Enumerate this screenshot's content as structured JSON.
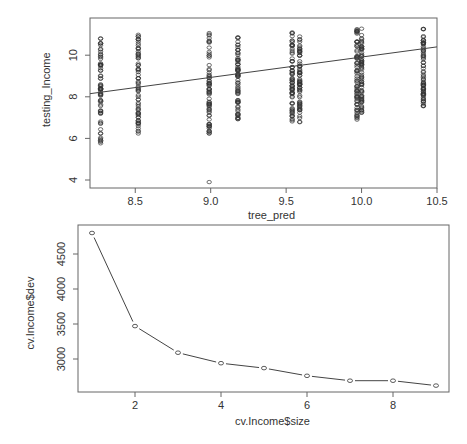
{
  "chart_data": [
    {
      "type": "scatter",
      "title": "",
      "xlabel": "tree_pred",
      "ylabel": "testing_Income",
      "xlim": [
        8.2,
        10.5
      ],
      "ylim": [
        3.7,
        11.6
      ],
      "x_ticks": [
        "8.5",
        "9.0",
        "9.5",
        "10.0",
        "10.5"
      ],
      "y_ticks": [
        "4",
        "6",
        "8",
        "10"
      ],
      "grid": false,
      "point_style": "open circles",
      "columns": [
        {
          "x": 8.27,
          "y_min": 5.7,
          "y_max": 11.3
        },
        {
          "x": 8.52,
          "y_min": 6.2,
          "y_max": 11.0
        },
        {
          "x": 8.99,
          "y_min": 6.2,
          "y_max": 11.3,
          "outlier": 3.9
        },
        {
          "x": 9.18,
          "y_min": 6.8,
          "y_max": 11.1
        },
        {
          "x": 9.54,
          "y_min": 6.8,
          "y_max": 11.1
        },
        {
          "x": 9.59,
          "y_min": 6.6,
          "y_max": 10.9
        },
        {
          "x": 9.97,
          "y_min": 6.9,
          "y_max": 11.3
        },
        {
          "x": 10.0,
          "y_min": 7.2,
          "y_max": 11.3
        },
        {
          "x": 10.41,
          "y_min": 7.5,
          "y_max": 11.3
        }
      ],
      "fit_line": {
        "x": [
          8.2,
          10.5
        ],
        "y": [
          8.15,
          10.4
        ]
      }
    },
    {
      "type": "line",
      "title": "",
      "xlabel": "cv.Income$size",
      "ylabel": "cv.Income$dev",
      "x": [
        1,
        2,
        3,
        4,
        5,
        6,
        7,
        8,
        9
      ],
      "series": [
        {
          "name": "dev",
          "values": [
            4800,
            3470,
            3090,
            2940,
            2870,
            2760,
            2690,
            2690,
            2620
          ]
        }
      ],
      "x_ticks": [
        "2",
        "4",
        "6",
        "8"
      ],
      "y_ticks": [
        "3000",
        "3500",
        "4000",
        "4500"
      ],
      "xlim": [
        0.67,
        9.33
      ],
      "ylim": [
        2560,
        4860
      ],
      "grid": false,
      "point_style": "open circles connected by line (type b)"
    }
  ],
  "plot1": {
    "xlabel": "tree_pred",
    "ylabel": "testing_Income",
    "x_ticks": [
      "8.5",
      "9.0",
      "9.5",
      "10.0",
      "10.5"
    ],
    "y_ticks": [
      "4",
      "6",
      "8",
      "10"
    ]
  },
  "plot2": {
    "xlabel": "cv.Income$size",
    "ylabel": "cv.Income$dev",
    "x_ticks": [
      "2",
      "4",
      "6",
      "8"
    ],
    "y_ticks": [
      "3000",
      "3500",
      "4000",
      "4500"
    ]
  },
  "colors": {
    "axis": "#555555",
    "points": "#333333",
    "line": "#444444"
  }
}
